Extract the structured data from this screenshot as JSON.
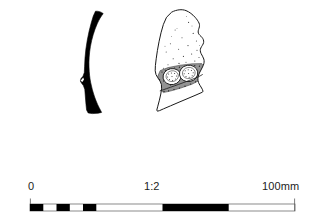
{
  "plate": {
    "type": "archaeological-illustration",
    "background_color": "#ffffff",
    "ink_color": "#000000",
    "caption": ""
  },
  "figures": [
    {
      "id": "figure-left",
      "name": "sherd-profile-section",
      "description": "Solid black curved vessel wall profile (section drawing)",
      "fill": "#000000",
      "stroke": "#000000",
      "position": {
        "x": 80,
        "y": 10,
        "width": 32,
        "height": 104
      }
    },
    {
      "id": "figure-right",
      "name": "sherd-exterior-view",
      "description": "Outlined sherd exterior with stippled surface and two circular impressed motifs",
      "fill": "#ffffff",
      "stroke": "#1a1a1a",
      "position": {
        "x": 152,
        "y": 8,
        "width": 68,
        "height": 106
      },
      "features": {
        "stipple": "true",
        "impressions": 2,
        "hatched_band": "true"
      }
    }
  ],
  "scale": {
    "name": "scale-bar",
    "ratio_label": "1:2",
    "start_label": "0",
    "end_label": "100mm",
    "unit": "mm",
    "min_value": 0,
    "max_value": 100,
    "bar_color": "#000000",
    "outline_color": "#555555",
    "segments": [
      {
        "from": 0,
        "to": 10,
        "filled": true
      },
      {
        "from": 10,
        "to": 20,
        "filled": false
      },
      {
        "from": 20,
        "to": 30,
        "filled": true
      },
      {
        "from": 30,
        "to": 40,
        "filled": false
      },
      {
        "from": 40,
        "to": 50,
        "filled": true
      },
      {
        "from": 50,
        "to": 100,
        "filled": false
      },
      {
        "from": 100,
        "to": 200,
        "filled": true
      },
      {
        "from": 200,
        "to": 300,
        "filled": false
      }
    ]
  }
}
